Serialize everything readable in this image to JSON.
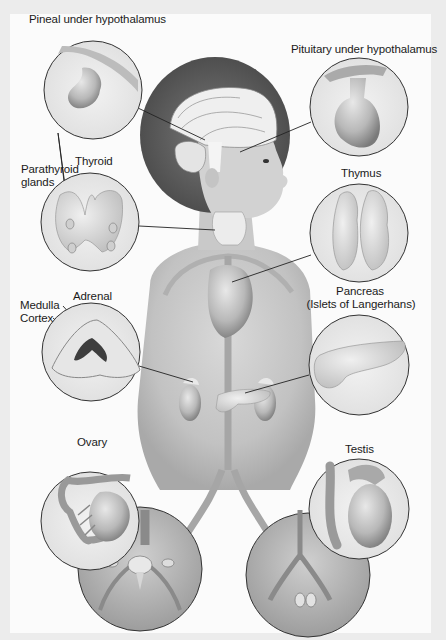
{
  "figure": {
    "background": "#ececec",
    "panel_background": "#fbfbfb",
    "stroke_color": "#222222",
    "labels": {
      "pineal": "Pineal under hypothalamus",
      "pituitary": "Pituitary under hypothalamus",
      "thyroid": "Thyroid",
      "parathyroid_line1": "Parathyroid",
      "parathyroid_line2": "glands",
      "thymus": "Thymus",
      "adrenal": "Adrenal",
      "medulla": "Medulla",
      "cortex": "Cortex",
      "pancreas_line1": "Pancreas",
      "pancreas_line2": "(Islets of Langerhans)",
      "ovary": "Ovary",
      "testis": "Testis"
    },
    "insets": [
      {
        "name": "pineal",
        "cx": 93,
        "cy": 90,
        "r": 49
      },
      {
        "name": "pituitary",
        "cx": 359,
        "cy": 107,
        "r": 49
      },
      {
        "name": "thyroid",
        "cx": 90,
        "cy": 222,
        "r": 49
      },
      {
        "name": "thymus",
        "cx": 359,
        "cy": 233,
        "r": 49
      },
      {
        "name": "adrenal",
        "cx": 91,
        "cy": 352,
        "r": 49
      },
      {
        "name": "pancreas",
        "cx": 359,
        "cy": 365,
        "r": 50
      },
      {
        "name": "ovary",
        "cx": 90,
        "cy": 521,
        "r": 49
      },
      {
        "name": "testis",
        "cx": 359,
        "cy": 509,
        "r": 50
      },
      {
        "name": "female-pelvis",
        "cx": 140,
        "cy": 569,
        "r": 62
      },
      {
        "name": "male-pelvis",
        "cx": 308,
        "cy": 575,
        "r": 62
      }
    ]
  }
}
